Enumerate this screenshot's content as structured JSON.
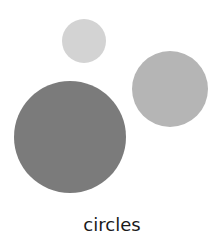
{
  "figure": {
    "caption": "circles",
    "circles": [
      {
        "name": "small-light-circle",
        "cx": 84,
        "cy": 41,
        "r": 22,
        "color": "#d3d3d3"
      },
      {
        "name": "medium-circle",
        "cx": 170,
        "cy": 89,
        "r": 38,
        "color": "#b5b5b5"
      },
      {
        "name": "large-dark-circle",
        "cx": 70,
        "cy": 137,
        "r": 56,
        "color": "#7b7b7b"
      }
    ]
  }
}
